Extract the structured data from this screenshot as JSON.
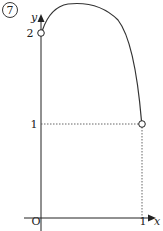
{
  "problem_number": "7",
  "axes": {
    "x_label": "x",
    "y_label": "y",
    "origin_label": "O"
  },
  "ticks": {
    "x_one": "1",
    "y_one": "1",
    "y_two": "2"
  },
  "points": [
    {
      "x": 0,
      "y": 2,
      "style": "open"
    },
    {
      "x": 1,
      "y": 1,
      "style": "open"
    }
  ],
  "colors": {
    "curve": "#333333",
    "axis": "#222222",
    "dotted": "#555555"
  }
}
